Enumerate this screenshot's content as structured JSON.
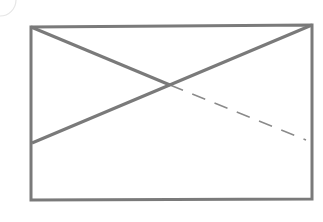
{
  "diagram": {
    "type": "geometric-line-figure",
    "width": 323,
    "height": 222,
    "background": "#ffffff",
    "stroke_color": "#7a7a7a",
    "dash_color": "#8a8a8a",
    "rectangle": {
      "top_left": [
        31,
        27
      ],
      "top_right": [
        312,
        25
      ],
      "bottom_right": [
        312,
        199
      ],
      "bottom_left": [
        31,
        200
      ],
      "stroke_width": 3
    },
    "lines": [
      {
        "name": "descending-solid",
        "from": [
          31,
          27
        ],
        "to": [
          170,
          85
        ],
        "style": "solid",
        "stroke_width": 3
      },
      {
        "name": "descending-dashed",
        "from": [
          170,
          85
        ],
        "to": [
          306,
          140
        ],
        "style": "dashed",
        "stroke_width": 1.5,
        "dash": "14 10"
      },
      {
        "name": "ascending-solid",
        "from": [
          32,
          143
        ],
        "to": [
          312,
          25
        ],
        "style": "solid",
        "stroke_width": 3
      }
    ],
    "intersection": [
      170,
      85
    ],
    "corner_artifact": {
      "center": [
        0,
        0
      ],
      "radius": 16,
      "color": "#e6e6e6"
    }
  }
}
